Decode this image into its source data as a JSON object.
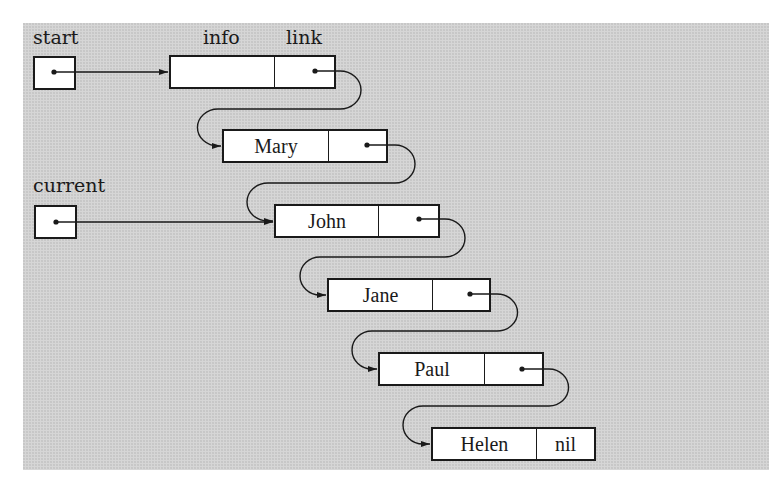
{
  "labels": {
    "start": "start",
    "current": "current",
    "info_header": "info",
    "link_header": "link"
  },
  "nodes": [
    {
      "id": "head",
      "info": "",
      "link": "pointer"
    },
    {
      "id": "n1",
      "info": "Mary",
      "link": "pointer"
    },
    {
      "id": "n2",
      "info": "John",
      "link": "pointer"
    },
    {
      "id": "n3",
      "info": "Jane",
      "link": "pointer"
    },
    {
      "id": "n4",
      "info": "Paul",
      "link": "pointer"
    },
    {
      "id": "n5",
      "info": "Helen",
      "link": "nil"
    }
  ],
  "nil_text": "nil",
  "pointers": [
    {
      "name": "start",
      "points_to": "head"
    },
    {
      "name": "current",
      "points_to": "n2"
    }
  ],
  "colors": {
    "background": "#d6d6d6",
    "box_fill": "#ffffff",
    "stroke": "#1a1a1a"
  }
}
